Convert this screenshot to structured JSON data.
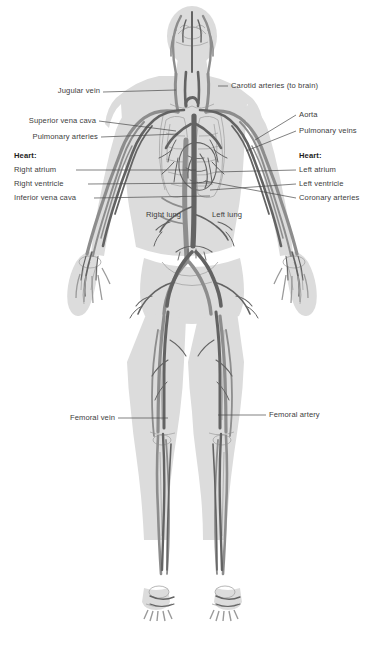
{
  "figure": {
    "domain": "anatomy-diagram",
    "background_color": "#ffffff",
    "body_fill": "#dcdcdc",
    "vessel_dark": "#6b6b6b",
    "vessel_mid": "#858585",
    "vessel_light": "#a8a8a8",
    "outline_color": "#8e8e8e",
    "label_color": "#3d3d3d",
    "leader_color": "#4a4a4a"
  },
  "labels": {
    "jugular_vein": "Jugular vein",
    "carotid_arteries": "Carotid arteries (to brain)",
    "superior_vena_cava": "Superior vena cava",
    "aorta": "Aorta",
    "pulmonary_arteries": "Pulmonary arteries",
    "pulmonary_veins": "Pulmonary veins",
    "heart_left_header": "Heart:",
    "heart_right_header": "Heart:",
    "right_atrium": "Right atrium",
    "left_atrium": "Left atrium",
    "right_ventricle": "Right ventricle",
    "left_ventricle": "Left ventricle",
    "inferior_vena_cava": "Inferior vena cava",
    "coronary_arteries": "Coronary arteries",
    "right_lung": "Right  lung",
    "left_lung": "Left lung",
    "femoral_vein": "Femoral vein",
    "femoral_artery": "Femoral artery"
  }
}
